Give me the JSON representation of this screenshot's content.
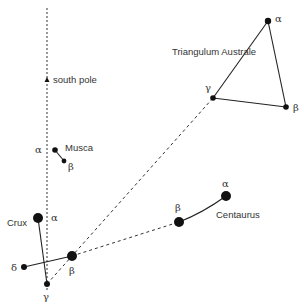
{
  "diagram": {
    "colors": {
      "ink": "#111111",
      "text": "#333333",
      "background": "#ffffff"
    },
    "pole_line": {
      "x": 47,
      "y1": 8,
      "y2": 290
    },
    "south_pole": {
      "label": "south pole",
      "x": 47,
      "y": 80
    },
    "constellations": {
      "triangulum": {
        "name": "Triangulum Australe",
        "label_pos": [
          172,
          55
        ],
        "stars": [
          {
            "id": "alpha",
            "glyph": "α",
            "x": 268,
            "y": 21,
            "r": 3.2,
            "label_pos": [
              275,
              22
            ]
          },
          {
            "id": "beta",
            "glyph": "β",
            "x": 286,
            "y": 107,
            "r": 2.8,
            "label_pos": [
              293,
              111
            ]
          },
          {
            "id": "gamma",
            "glyph": "γ",
            "x": 213,
            "y": 98,
            "r": 2.8,
            "label_pos": [
              205,
              91
            ]
          }
        ]
      },
      "musca": {
        "name": "Musca",
        "label_pos": [
          65,
          151
        ],
        "stars": [
          {
            "id": "alpha",
            "glyph": "α",
            "x": 55,
            "y": 150,
            "r": 2.8,
            "label_pos": [
              35,
              153
            ]
          },
          {
            "id": "beta",
            "glyph": "β",
            "x": 64,
            "y": 161,
            "r": 2.4,
            "label_pos": [
              68,
              170
            ]
          }
        ]
      },
      "crux": {
        "name": "Crux",
        "label_pos": [
          7,
          226
        ],
        "stars": [
          {
            "id": "alpha",
            "glyph": "α",
            "x": 38,
            "y": 218,
            "r": 5,
            "label_pos": [
              51,
              221
            ]
          },
          {
            "id": "beta",
            "glyph": "β",
            "x": 72,
            "y": 256,
            "r": 5,
            "label_pos": [
              69,
              274
            ]
          },
          {
            "id": "gamma",
            "glyph": "γ",
            "x": 47,
            "y": 284,
            "r": 3,
            "label_pos": [
              43,
              300
            ]
          },
          {
            "id": "delta",
            "glyph": "δ",
            "x": 24,
            "y": 267,
            "r": 3,
            "label_pos": [
              11,
              271
            ]
          }
        ]
      },
      "centaurus": {
        "name": "Centaurus",
        "label_pos": [
          216,
          218
        ],
        "stars": [
          {
            "id": "alpha",
            "glyph": "α",
            "x": 226,
            "y": 196,
            "r": 5,
            "label_pos": [
              222,
              187
            ]
          },
          {
            "id": "beta",
            "glyph": "β",
            "x": 179,
            "y": 222,
            "r": 5,
            "label_pos": [
              175,
              211
            ]
          }
        ]
      }
    }
  }
}
